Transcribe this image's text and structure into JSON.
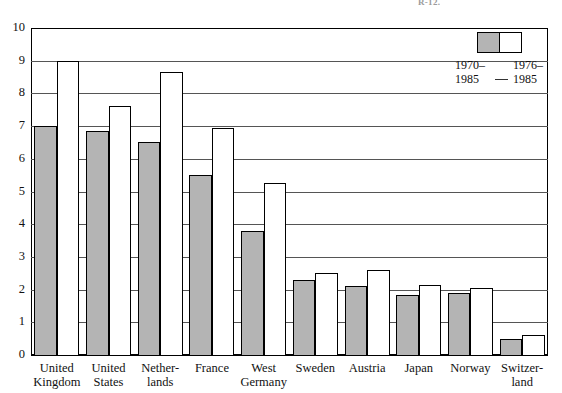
{
  "figure": {
    "top_caption_fragment": "R-12.",
    "background_color": "#ffffff",
    "shaded_color": "#b4b4b4",
    "open_color": "#ffffff",
    "line_color": "#000000"
  },
  "legend": {
    "entries": [
      {
        "swatch": "shaded",
        "line1": "1970–",
        "line2": "1985"
      },
      {
        "swatch": "open",
        "line1": "1976–",
        "line2": "1985"
      }
    ]
  },
  "chart_data": {
    "type": "bar",
    "title": "",
    "subtitle": "",
    "xlabel": "",
    "ylabel": "",
    "ylim": [
      0,
      10
    ],
    "ytick_labels": [
      "0",
      "1",
      "2",
      "3",
      "4",
      "5",
      "6",
      "7",
      "8",
      "9",
      "10"
    ],
    "ytick_values": [
      0,
      1,
      2,
      3,
      4,
      5,
      6,
      7,
      8,
      9,
      10
    ],
    "grid": true,
    "grid_axis": "y",
    "legend_position": "top-right",
    "categories": [
      "United Kingdom",
      "United States",
      "Netherlands",
      "France",
      "West Germany",
      "Sweden",
      "Austria",
      "Japan",
      "Norway",
      "Switzerland"
    ],
    "category_label_lines": [
      [
        "United",
        "Kingdom"
      ],
      [
        "United",
        "States"
      ],
      [
        "Nether-",
        "lands"
      ],
      [
        "France",
        ""
      ],
      [
        "West",
        "Germany"
      ],
      [
        "Sweden",
        ""
      ],
      [
        "Austria",
        ""
      ],
      [
        "Japan",
        ""
      ],
      [
        "Norway",
        ""
      ],
      [
        "Switzer-",
        "land"
      ]
    ],
    "series": [
      {
        "name": "1970–1985",
        "style": "shaded",
        "values": [
          7.0,
          6.85,
          6.5,
          5.5,
          3.8,
          2.3,
          2.1,
          1.85,
          1.9,
          0.5
        ]
      },
      {
        "name": "1976–1985",
        "style": "open",
        "values": [
          9.0,
          7.6,
          8.65,
          6.95,
          5.25,
          2.5,
          2.6,
          2.15,
          2.05,
          0.6
        ]
      }
    ]
  }
}
